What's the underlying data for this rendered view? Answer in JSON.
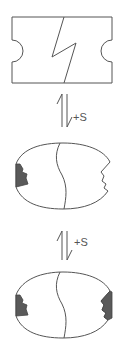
{
  "diagram": {
    "colors": {
      "line": "#555555",
      "bound_fill": "#5a5a5a",
      "background": "#ffffff"
    },
    "steps": [
      {
        "name": "closed-state",
        "shape": "notched-rectangle"
      },
      {
        "arrow_label": "+S"
      },
      {
        "name": "open-state-one-bound",
        "shape": "ellipse",
        "left_site": "filled",
        "right_site": "empty"
      },
      {
        "arrow_label": "+S"
      },
      {
        "name": "open-state-two-bound",
        "shape": "ellipse",
        "left_site": "filled",
        "right_site": "filled"
      }
    ]
  }
}
